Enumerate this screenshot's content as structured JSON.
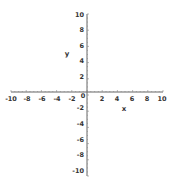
{
  "chart_data": {
    "type": "scatter",
    "title": "",
    "xlabel": "x",
    "ylabel": "y",
    "xlim": [
      -10,
      10
    ],
    "ylim": [
      -10,
      10
    ],
    "grid": false,
    "legend": null,
    "x_ticks": [
      "-10",
      "-8",
      "-6",
      "-4",
      "-2",
      "0",
      "2",
      "4",
      "6",
      "8",
      "10"
    ],
    "y_ticks": [
      "10",
      "8",
      "6",
      "4",
      "2",
      "0",
      "-2",
      "-4",
      "-6",
      "-8",
      "-10"
    ],
    "series": []
  },
  "colors": {
    "axis": "#555555",
    "text": "#333333",
    "background": "#ffffff"
  }
}
